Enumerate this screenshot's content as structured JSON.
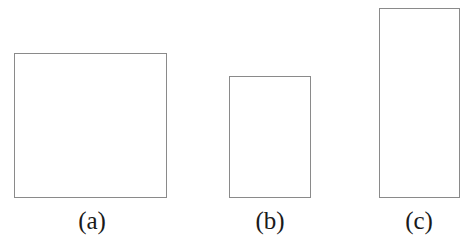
{
  "figure": {
    "caption_style": "parenthesized-lowercase-letters",
    "background_color": "#ffffff",
    "stroke_color": "#8a8a8a",
    "label_color": "#1a1a1a",
    "stroke_width_px": 1,
    "label_font_size_px": 25,
    "canvas": {
      "width": 466,
      "height": 246
    },
    "baseline_y": 198,
    "shapes": [
      {
        "label": "(a)",
        "kind": "square",
        "x": 14,
        "y": 53,
        "width": 153,
        "height": 145,
        "label_center_x": 92,
        "label_top": 208
      },
      {
        "label": "(b)",
        "kind": "rectangle-portrait-short",
        "x": 229,
        "y": 76,
        "width": 82,
        "height": 122,
        "label_center_x": 270,
        "label_top": 208
      },
      {
        "label": "(c)",
        "kind": "rectangle-portrait-tall",
        "x": 379,
        "y": 8,
        "width": 81,
        "height": 190,
        "label_center_x": 419,
        "label_top": 208
      }
    ]
  }
}
